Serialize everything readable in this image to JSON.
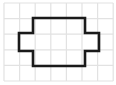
{
  "figure": {
    "canvas": {
      "width": 116,
      "height": 85,
      "background": "#ffffff"
    },
    "grid": {
      "label": "graph-paper-grid",
      "line_color": "#e2e2e2",
      "line_width": 1.2,
      "cell_size": 15.6,
      "origin_x": 4,
      "origin_y": 3,
      "columns": 7,
      "rows": 5,
      "x_lines": [
        4,
        19.6,
        35.2,
        50.8,
        66.4,
        82,
        97.6,
        113.2
      ],
      "y_lines": [
        3,
        18.6,
        34.2,
        49.8,
        65.4,
        81
      ]
    },
    "shape": {
      "label": "cross-polygon",
      "description": "rectangle with left and right side arms forming a plus/cross outline",
      "stroke_color": "#1a1a1a",
      "stroke_width": 2.6,
      "fill": "none",
      "points": "33,18 85,18 85,33 99,33 99,51 85,51 85,66 33,66 33,51 19,51 19,33 33,33",
      "vertices": [
        [
          33,
          18
        ],
        [
          85,
          18
        ],
        [
          85,
          33
        ],
        [
          99,
          33
        ],
        [
          99,
          51
        ],
        [
          85,
          51
        ],
        [
          85,
          66
        ],
        [
          33,
          66
        ],
        [
          33,
          51
        ],
        [
          19,
          51
        ],
        [
          19,
          33
        ],
        [
          33,
          33
        ]
      ],
      "bounding_box": {
        "x": 19,
        "y": 18,
        "width": 80,
        "height": 48
      },
      "body_rect": {
        "x": 33,
        "y": 18,
        "width": 52,
        "height": 48
      },
      "left_arm": {
        "x": 19,
        "y": 33,
        "width": 14,
        "height": 18
      },
      "right_arm": {
        "x": 85,
        "y": 33,
        "width": 14,
        "height": 18
      }
    }
  }
}
